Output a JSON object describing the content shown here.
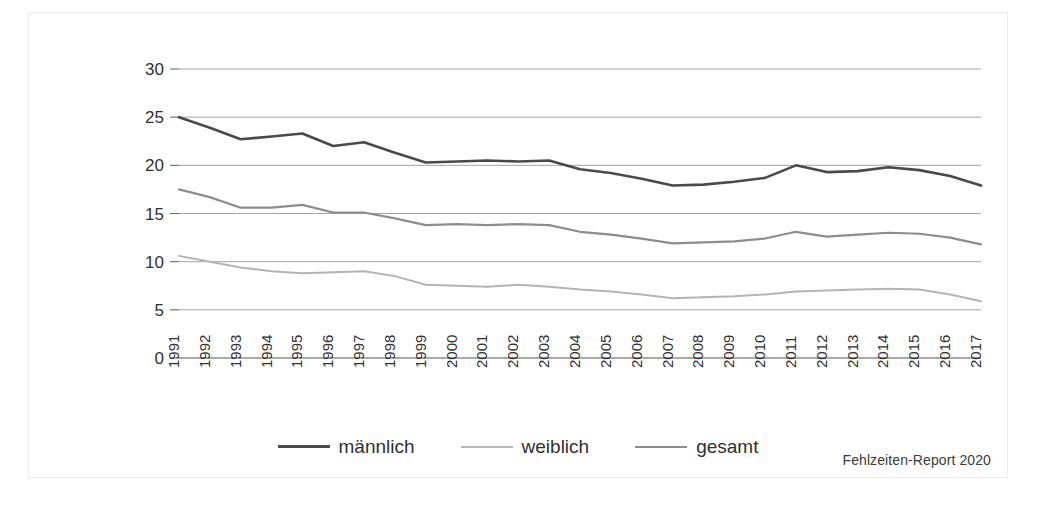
{
  "chart_data": {
    "type": "line",
    "title": "",
    "subtitle": "",
    "xlabel": "",
    "ylabel": "",
    "xlim": [
      1991,
      2017
    ],
    "ylim": [
      0,
      30
    ],
    "yticks": [
      0,
      5,
      10,
      15,
      20,
      25,
      30
    ],
    "grid": true,
    "legend_position": "bottom-center",
    "categories": [
      "1991",
      "1992",
      "1993",
      "1994",
      "1995",
      "1996",
      "1997",
      "1998",
      "1999",
      "2000",
      "2001",
      "2002",
      "2003",
      "2004",
      "2005",
      "2006",
      "2007",
      "2008",
      "2009",
      "2010",
      "2011",
      "2012",
      "2013",
      "2014",
      "2015",
      "2016",
      "2017"
    ],
    "series": [
      {
        "name": "männlich",
        "color": "#4a4a4a",
        "width": 2.6,
        "values": [
          25.0,
          23.9,
          22.7,
          23.0,
          23.3,
          22.0,
          22.4,
          21.3,
          20.3,
          20.4,
          20.5,
          20.4,
          20.5,
          19.6,
          19.2,
          18.6,
          17.9,
          18.0,
          18.3,
          18.7,
          20.0,
          19.3,
          19.4,
          19.8,
          19.5,
          18.9,
          17.9
        ]
      },
      {
        "name": "weiblich",
        "color": "#b4b4b4",
        "width": 2.0,
        "values": [
          10.6,
          10.0,
          9.4,
          9.0,
          8.8,
          8.9,
          9.0,
          8.5,
          7.6,
          7.5,
          7.4,
          7.6,
          7.4,
          7.1,
          6.9,
          6.6,
          6.2,
          6.3,
          6.4,
          6.6,
          6.9,
          7.0,
          7.1,
          7.2,
          7.1,
          6.6,
          5.9
        ]
      },
      {
        "name": "gesamt",
        "color": "#8d8d8d",
        "width": 2.2,
        "values": [
          17.5,
          16.7,
          15.6,
          15.6,
          15.9,
          15.1,
          15.1,
          14.5,
          13.8,
          13.9,
          13.8,
          13.9,
          13.8,
          13.1,
          12.8,
          12.4,
          11.9,
          12.0,
          12.1,
          12.4,
          13.1,
          12.6,
          12.8,
          13.0,
          12.9,
          12.5,
          11.8
        ]
      }
    ]
  },
  "legend": {
    "items": [
      {
        "label": "männlich",
        "color": "#4a4a4a",
        "thickness": "3px"
      },
      {
        "label": "weiblich",
        "color": "#b8b8b8",
        "thickness": "2px"
      },
      {
        "label": "gesamt",
        "color": "#8d8d8d",
        "thickness": "2px"
      }
    ]
  },
  "source": {
    "note": "Fehlzeiten-Report 2020"
  }
}
